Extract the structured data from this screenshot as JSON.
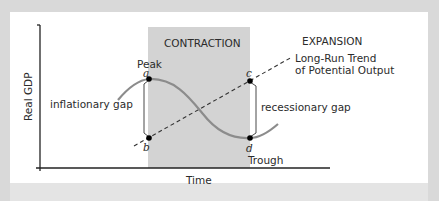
{
  "diagram": {
    "y_axis_label": "Real GDP",
    "x_axis_label": "Time",
    "regions": {
      "contraction": "CONTRACTION",
      "expansion": "EXPANSION"
    },
    "trend_label_line1": "Long-Run Trend",
    "trend_label_line2": "of Potential Output",
    "points": {
      "a": "a",
      "b": "b",
      "c": "c",
      "d": "d"
    },
    "peak_label": "Peak",
    "trough_label": "Trough",
    "gaps": {
      "inflationary": "inflationary gap",
      "recessionary": "recessionary gap"
    },
    "colors": {
      "frame": "#d9d9d9",
      "shade": "#d3d3d3",
      "curve": "#8c8c8c",
      "axis": "#222222",
      "point": "#000000"
    }
  }
}
